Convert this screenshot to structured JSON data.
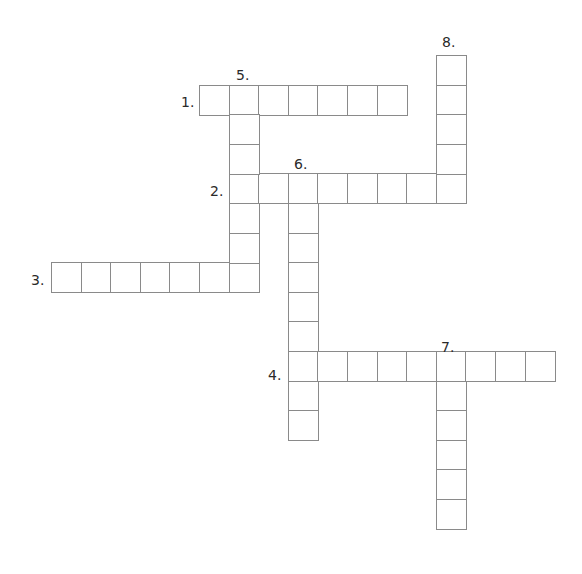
{
  "puzzle": {
    "type": "crossword",
    "cell_size": 29.6,
    "grid_origin": {
      "x": 51,
      "y": 55
    },
    "border_color": "#8a8a8a",
    "entries": [
      {
        "number": "1.",
        "direction": "across",
        "length": 7,
        "start_col": 5,
        "start_row": 1,
        "label_x": 181,
        "label_y": 95
      },
      {
        "number": "2.",
        "direction": "across",
        "length": 8,
        "start_col": 6,
        "start_row": 4,
        "label_x": 210,
        "label_y": 184
      },
      {
        "number": "3.",
        "direction": "across",
        "length": 7,
        "start_col": 0,
        "start_row": 7,
        "label_x": 31,
        "label_y": 273
      },
      {
        "number": "4.",
        "direction": "across",
        "length": 9,
        "start_col": 8,
        "start_row": 10,
        "label_x": 268,
        "label_y": 368
      },
      {
        "number": "5.",
        "direction": "down",
        "length": 7,
        "start_col": 6,
        "start_row": 1,
        "label_x": 236,
        "label_y": 68
      },
      {
        "number": "6.",
        "direction": "down",
        "length": 9,
        "start_col": 8,
        "start_row": 4,
        "label_x": 294,
        "label_y": 157
      },
      {
        "number": "7.",
        "direction": "down",
        "length": 6,
        "start_col": 13,
        "start_row": 10,
        "label_x": 441,
        "label_y": 340
      },
      {
        "number": "8.",
        "direction": "down",
        "length": 5,
        "start_col": 13,
        "start_row": 0,
        "label_x": 442,
        "label_y": 35
      }
    ]
  }
}
